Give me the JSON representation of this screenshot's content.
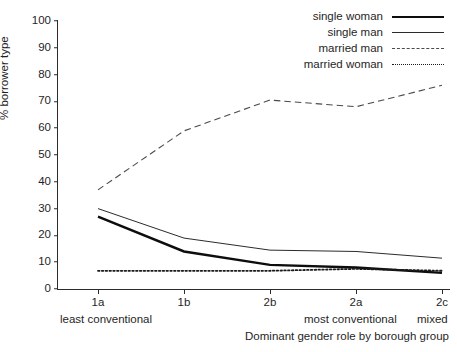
{
  "chart_data": {
    "type": "line",
    "title": "",
    "xlabel": "Dominant gender role by borough group",
    "ylabel": "% borrower type",
    "categories": [
      "1a",
      "1b",
      "2b",
      "2a",
      "2c"
    ],
    "category_sublabels": [
      {
        "category": "1a",
        "label": "least conventional"
      },
      {
        "category": "2a",
        "label": "most conventional"
      },
      {
        "category": "2c",
        "label": "mixed"
      }
    ],
    "ylim": [
      0,
      100
    ],
    "ytick_step": 10,
    "yticks": [
      100,
      90,
      80,
      70,
      60,
      50,
      40,
      30,
      20,
      10,
      0
    ],
    "grid": false,
    "legend_position": "top-right",
    "series": [
      {
        "name": "single woman",
        "style": "solid-thick",
        "color": "#0d0d0d",
        "values": [
          27,
          14,
          9,
          8,
          6
        ]
      },
      {
        "name": "single man",
        "style": "solid-thin",
        "color": "#2b2b2b",
        "values": [
          30,
          19,
          14.5,
          14,
          11.5
        ]
      },
      {
        "name": "married man",
        "style": "dashed",
        "color": "#4a4a4a",
        "values": [
          37,
          59,
          70.5,
          68,
          76
        ]
      },
      {
        "name": "married woman",
        "style": "dotted",
        "color": "#1a1a1a",
        "values": [
          6.8,
          6.8,
          6.8,
          7.5,
          6.8
        ]
      }
    ]
  },
  "axis": {
    "y_title": "% borrower type",
    "x_title": "Dominant gender role by borough group",
    "y_ticks": [
      "100",
      "90",
      "80",
      "70",
      "60",
      "50",
      "40",
      "30",
      "20",
      "10",
      "0"
    ],
    "x_ticks": [
      "1a",
      "1b",
      "2b",
      "2a",
      "2c"
    ],
    "x_sub_left": "least conventional",
    "x_sub_mid": "most conventional",
    "x_sub_right": "mixed"
  },
  "legend": {
    "items": [
      {
        "label": "single woman",
        "style": "solid-thick"
      },
      {
        "label": "single man",
        "style": "solid-thin"
      },
      {
        "label": "married man",
        "style": "dashed"
      },
      {
        "label": "married woman",
        "style": "dotted"
      }
    ]
  }
}
